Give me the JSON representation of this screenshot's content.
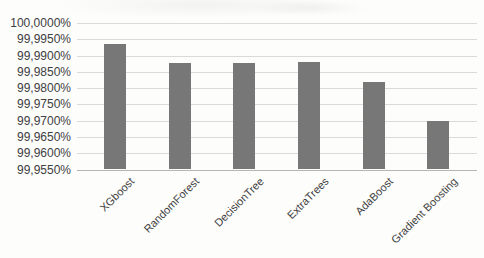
{
  "chart_data": {
    "type": "bar",
    "title": "",
    "xlabel": "",
    "ylabel": "",
    "categories": [
      "XGboost",
      "RandomForest",
      "DecisionTree",
      "ExtraTrees",
      "AdaBoost",
      "Gradient Boosting"
    ],
    "values": [
      99.9934,
      99.9878,
      99.9878,
      99.988,
      99.982,
      99.97
    ],
    "value_unit": "%",
    "ylim": [
      99.955,
      100.0
    ],
    "y_tick_step": 0.005,
    "y_tick_labels": [
      "100,0000%",
      "99,9950%",
      "99,9900%",
      "99,9850%",
      "99,9800%",
      "99,9750%",
      "99,9700%",
      "99,9650%",
      "99,9600%",
      "99,9550%"
    ],
    "decimal_separator": ",",
    "grid": "horizontal",
    "legend": "none",
    "x_label_rotation_deg": 45,
    "colors": {
      "bar": "#777777",
      "gridline": "#dadada",
      "axis_line": "#b5b5b5",
      "text": "#404040",
      "background": "#fdfdfc"
    }
  }
}
